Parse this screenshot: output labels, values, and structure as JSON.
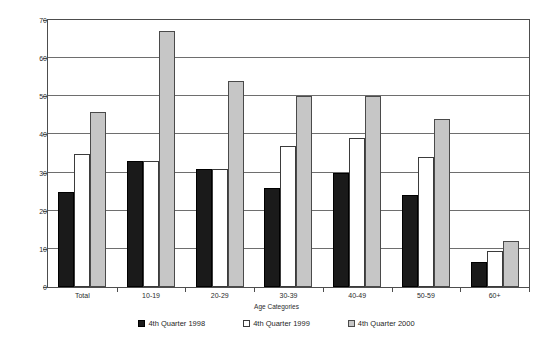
{
  "chart_data": {
    "type": "bar",
    "title": "",
    "subtitle": "",
    "xlabel": "Age Categories",
    "ylabel": "% of Population",
    "categories": [
      "Total",
      "10-19",
      "20-29",
      "30-39",
      "40-49",
      "50-59",
      "60+"
    ],
    "series": [
      {
        "name": "4th Quarter 1998",
        "color": "#1a1a1a",
        "values": [
          25,
          33,
          31,
          26,
          30,
          24,
          6.5
        ]
      },
      {
        "name": "4th Quarter 1999",
        "color": "#ffffff",
        "values": [
          35,
          33,
          31,
          37,
          39,
          34,
          9.5
        ]
      },
      {
        "name": "4th Quarter 2000",
        "color": "#c6c6c6",
        "values": [
          46,
          67,
          54,
          50,
          50,
          44,
          12
        ]
      }
    ],
    "ylim": [
      0,
      70
    ],
    "ytick_values": [
      0,
      10,
      20,
      30,
      40,
      50,
      60,
      70
    ],
    "ytick_labels": [
      "0",
      "10",
      "20",
      "30",
      "40",
      "50",
      "60",
      "70"
    ],
    "grid": "horizontal",
    "legend_position": "bottom",
    "axis_color": "#4d4d4d",
    "grid_color": "#6e6e6e",
    "background": "#ffffff"
  },
  "legend": {
    "items": [
      {
        "label": "4th Quarter 1998",
        "swatch": "black-square-icon"
      },
      {
        "label": "4th Quarter 1999",
        "swatch": "white-square-icon"
      },
      {
        "label": "4th Quarter 2000",
        "swatch": "gray-square-icon"
      }
    ]
  }
}
